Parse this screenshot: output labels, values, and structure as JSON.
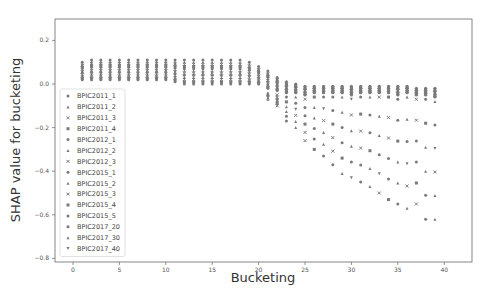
{
  "chart_data": {
    "type": "scatter",
    "title": "",
    "xlabel": "Bucketing",
    "ylabel": "SHAP value for bucketing",
    "xlim": [
      -2.5,
      43
    ],
    "ylim": [
      -0.8,
      0.3
    ],
    "xticks": [
      0,
      5,
      10,
      15,
      20,
      25,
      30,
      35,
      40
    ],
    "yticks": [
      0.2,
      0.0,
      -0.2,
      -0.4,
      -0.6,
      -0.8
    ],
    "ytick_labels": [
      "0.2",
      "0.0",
      "−0.2",
      "−0.4",
      "−0.6",
      "−0.8"
    ],
    "grid": false,
    "legend_position": "lower left",
    "marker_color": "#7a7a7a",
    "series": [
      {
        "name": "BPIC2011_1",
        "marker": "circle"
      },
      {
        "name": "BPIC2011_2",
        "marker": "triangle"
      },
      {
        "name": "BPIC2011_3",
        "marker": "x"
      },
      {
        "name": "BPIC2011_4",
        "marker": "square"
      },
      {
        "name": "BPIC2012_1",
        "marker": "circle"
      },
      {
        "name": "BPIC2012_2",
        "marker": "triangle"
      },
      {
        "name": "BPIC2012_3",
        "marker": "x"
      },
      {
        "name": "BPIC2015_1",
        "marker": "circle"
      },
      {
        "name": "BPIC2015_2",
        "marker": "triangle"
      },
      {
        "name": "BPIC2015_3",
        "marker": "x"
      },
      {
        "name": "BPIC2015_4",
        "marker": "square"
      },
      {
        "name": "BPIC2015_5",
        "marker": "circle"
      },
      {
        "name": "BPIC2017_20",
        "marker": "circle"
      },
      {
        "name": "BPIC2017_30",
        "marker": "triangle"
      },
      {
        "name": "BPIC2017_40",
        "marker": "triangle-down"
      }
    ],
    "clusters": {
      "x": [
        1,
        2,
        3,
        4,
        5,
        6,
        7,
        8,
        9,
        10,
        11,
        12,
        13,
        14,
        15,
        16,
        17,
        18,
        19,
        20,
        21,
        22,
        23,
        24,
        25,
        26,
        27,
        28,
        29,
        30,
        31,
        32,
        33,
        34,
        35,
        36,
        37,
        38,
        39
      ],
      "upper_band_max": [
        0.1,
        0.11,
        0.11,
        0.11,
        0.11,
        0.11,
        0.11,
        0.11,
        0.11,
        0.11,
        0.11,
        0.11,
        0.11,
        0.11,
        0.11,
        0.11,
        0.11,
        0.11,
        0.1,
        0.08,
        0.06,
        0.03,
        0.01,
        0.0,
        -0.01,
        -0.01,
        -0.01,
        -0.01,
        -0.01,
        -0.01,
        -0.01,
        -0.01,
        -0.01,
        -0.01,
        -0.01,
        -0.01,
        -0.02,
        -0.02,
        -0.02
      ],
      "upper_band_min": [
        0.02,
        0.02,
        0.02,
        0.02,
        0.02,
        0.02,
        0.02,
        0.02,
        0.02,
        0.02,
        0.01,
        0.0,
        0.0,
        0.0,
        0.0,
        0.0,
        0.0,
        0.0,
        0.0,
        0.0,
        -0.02,
        -0.03,
        -0.04,
        -0.04,
        -0.05,
        -0.04,
        -0.04,
        -0.04,
        -0.04,
        -0.05,
        -0.04,
        -0.04,
        -0.04,
        -0.04,
        -0.05,
        -0.04,
        -0.05,
        -0.05,
        -0.06
      ],
      "lower_tail_min": [
        null,
        null,
        null,
        null,
        null,
        null,
        null,
        null,
        null,
        null,
        null,
        null,
        null,
        null,
        null,
        null,
        null,
        null,
        null,
        null,
        -0.07,
        -0.1,
        -0.17,
        -0.2,
        -0.26,
        -0.3,
        -0.33,
        -0.37,
        -0.41,
        -0.43,
        -0.45,
        -0.47,
        -0.5,
        -0.53,
        -0.55,
        -0.57,
        -0.55,
        -0.62,
        -0.62
      ]
    }
  },
  "figure": {
    "x_axis_title": "Bucketing",
    "y_axis_title": "SHAP value for bucketing"
  }
}
